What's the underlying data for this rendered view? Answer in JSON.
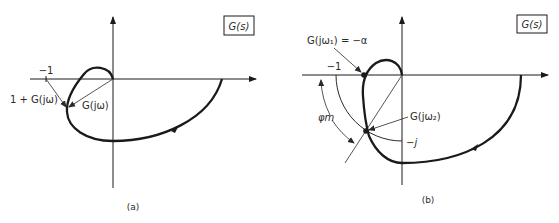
{
  "figure": {
    "panel_a": {
      "caption": "(a)",
      "box_label": "G(s)",
      "labels": {
        "minus_one": "−1",
        "one_plus_g": "1 + G(jω)",
        "g_jw": "G(jω)"
      }
    },
    "panel_b": {
      "caption": "(b)",
      "box_label": "G(s)",
      "labels": {
        "g_jw1": "G(jω₁) = −α",
        "minus_one": "−1",
        "phase_margin": "φm",
        "g_jw2": "G(jω₂)",
        "minus_j": "−j"
      }
    }
  },
  "colors": {
    "ink": "#1a1a1a",
    "thin_line": "#3a3a3a",
    "background": "#ffffff"
  }
}
